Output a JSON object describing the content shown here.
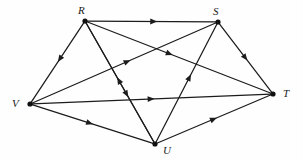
{
  "figure": {
    "name": "directed-graph-diagram",
    "background_color": "#fefefe",
    "stroke_color": "#1c1c1c",
    "vertex_color": "#111111",
    "label_color": "#1a1a1a"
  },
  "vertices": [
    {
      "id": "R",
      "label": "R",
      "x": 85,
      "y": 21,
      "label_x": 78,
      "label_y": 5
    },
    {
      "id": "S",
      "label": "S",
      "x": 218,
      "y": 22,
      "label_x": 213,
      "label_y": 6
    },
    {
      "id": "T",
      "label": "T",
      "x": 273,
      "y": 94,
      "label_x": 283,
      "label_y": 88
    },
    {
      "id": "U",
      "label": "U",
      "x": 155,
      "y": 144,
      "label_x": 163,
      "label_y": 145
    },
    {
      "id": "V",
      "label": "V",
      "x": 30,
      "y": 104,
      "label_x": 12,
      "label_y": 98
    }
  ],
  "edges": [
    {
      "from": "R",
      "to": "S",
      "arrow_at": 0.52
    },
    {
      "from": "R",
      "to": "V",
      "arrow_at": 0.46
    },
    {
      "from": "R",
      "to": "T",
      "arrow_at": 0.45
    },
    {
      "from": "R",
      "to": "U",
      "arrow_at": 0.6
    },
    {
      "from": "S",
      "to": "T",
      "arrow_at": 0.5
    },
    {
      "from": "U",
      "to": "S",
      "arrow_at": 0.55
    },
    {
      "from": "V",
      "to": "S",
      "arrow_at": 0.52
    },
    {
      "from": "V",
      "to": "T",
      "arrow_at": 0.5
    },
    {
      "from": "V",
      "to": "U",
      "arrow_at": 0.48
    },
    {
      "from": "U",
      "to": "T",
      "arrow_at": 0.5
    },
    {
      "from": "U",
      "to": "R",
      "arrow_at": 0.52
    }
  ]
}
